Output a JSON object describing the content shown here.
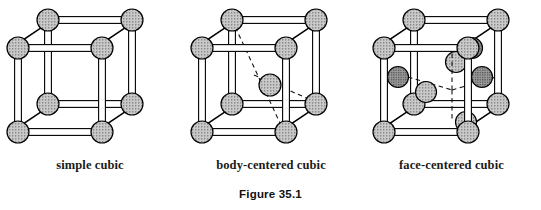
{
  "figure": {
    "caption": "Figure 35.1",
    "background_color": "#ffffff",
    "ink_color": "#000000",
    "sphere_fill_light": "#a8a8a8",
    "sphere_fill_dark": "#6e6e6e",
    "rod_fill": "#ffffff"
  },
  "structures": [
    {
      "id": "simple-cubic",
      "label": "simple cubic",
      "corner_atoms": 8,
      "interior_atoms": 0,
      "face_atoms": 0,
      "dashed_guides": 0
    },
    {
      "id": "body-centered-cubic",
      "label": "body-centered cubic",
      "corner_atoms": 8,
      "interior_atoms": 1,
      "face_atoms": 0,
      "dashed_guides": 2
    },
    {
      "id": "face-centered-cubic",
      "label": "face-centered cubic",
      "corner_atoms": 8,
      "interior_atoms": 0,
      "face_atoms": 6,
      "dashed_guides": 4
    }
  ],
  "geometry": {
    "cube_front_left_x": 18,
    "cube_front_top_y": 48,
    "cube_side": 84,
    "depth_dx": 30,
    "depth_dy": -28,
    "corner_radius": 11,
    "face_radius": 10.5,
    "center_radius": 10.5,
    "rod_halfwidth": 3.4
  }
}
